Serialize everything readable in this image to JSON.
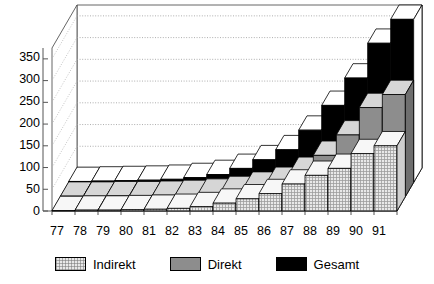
{
  "chart_data": {
    "type": "bar",
    "title": "",
    "subtitle": "",
    "xlabel": "",
    "ylabel": "",
    "categories": [
      "77",
      "78",
      "79",
      "80",
      "81",
      "82",
      "83",
      "84",
      "85",
      "86",
      "87",
      "88",
      "89",
      "90",
      "91"
    ],
    "ylim": [
      0,
      375
    ],
    "yticks": [
      0,
      50,
      100,
      150,
      200,
      250,
      300,
      350
    ],
    "grid": true,
    "legend_position": "bottom",
    "projection": "3d-rows",
    "series": [
      {
        "name": "Indirekt",
        "color": "#e8e8e8",
        "pattern": "cross-hatch",
        "row": "front",
        "values": [
          1,
          2,
          2,
          3,
          4,
          6,
          10,
          18,
          28,
          40,
          62,
          82,
          98,
          132,
          150
        ]
      },
      {
        "name": "Direkt",
        "color": "#8d8d8d",
        "pattern": "solid",
        "row": "middle",
        "values": [
          1,
          1,
          2,
          2,
          3,
          5,
          8,
          14,
          24,
          35,
          58,
          95,
          142,
          205,
          235
        ]
      },
      {
        "name": "Gesamt",
        "color": "#000000",
        "pattern": "solid",
        "row": "back",
        "values": [
          2,
          3,
          4,
          5,
          7,
          11,
          18,
          32,
          52,
          75,
          120,
          177,
          240,
          320,
          375
        ]
      }
    ]
  },
  "axes": {
    "y_tick_labels": [
      "350",
      "300",
      "250",
      "200",
      "150",
      "100",
      "50",
      "0"
    ],
    "x_tick_labels": [
      "77",
      "78",
      "79",
      "80",
      "81",
      "82",
      "83",
      "84",
      "85",
      "86",
      "87",
      "88",
      "89",
      "90",
      "91"
    ]
  },
  "legend": {
    "items": [
      {
        "label": "Indirekt",
        "swatch": "indirekt-swatch"
      },
      {
        "label": "Direkt",
        "swatch": "direkt-swatch"
      },
      {
        "label": "Gesamt",
        "swatch": "gesamt-swatch"
      }
    ]
  },
  "colors": {
    "indirekt": "#e8e8e8",
    "direkt": "#8d8d8d",
    "gesamt": "#000000",
    "axis": "#555555",
    "grid": "#999999",
    "outline": "#000000"
  }
}
